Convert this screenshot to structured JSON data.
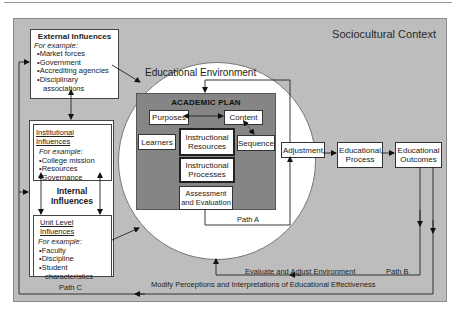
{
  "context": {
    "title": "Sociocultural Context"
  },
  "external": {
    "title": "External Influences",
    "for_example": "For example:",
    "items": [
      "Market forces",
      "Government",
      "Accrediting agencies",
      "Disciplinary"
    ],
    "item_cont": "associations"
  },
  "internal": {
    "title_line1": "Internal",
    "title_line2": "Influences",
    "institutional": {
      "title": "Institutional Influences",
      "for_example": "For example:",
      "items": [
        "College mission",
        "Resources",
        "Governance"
      ]
    },
    "unit": {
      "title": "Unit Level Influences",
      "for_example": "For example:",
      "items": [
        "Faculty",
        "Discipline",
        "Student"
      ],
      "item_cont": "characteristics"
    }
  },
  "environment": {
    "title": "Educational Environment"
  },
  "plan": {
    "title": "ACADEMIC PLAN",
    "purposes": "Purposes",
    "content": "Content",
    "learners": "Learners",
    "resources_l1": "Instructional",
    "resources_l2": "Resources",
    "sequence": "Sequence",
    "processes_l1": "Instructional",
    "processes_l2": "Processes",
    "assessment_l1": "Assessment",
    "assessment_l2": "and Evaluation"
  },
  "flow": {
    "adjustment": "Adjustment",
    "process_l1": "Educational",
    "process_l2": "Process",
    "outcomes_l1": "Educational",
    "outcomes_l2": "Outcomes"
  },
  "paths": {
    "path_a": "Path A",
    "path_b": "Path B",
    "path_c": "Path C",
    "evaluate": "Evaluate and Adjust Environment",
    "modify": "Modify Perceptions and Interpretations of Educational Effectiveness"
  }
}
